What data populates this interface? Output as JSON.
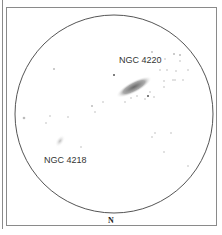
{
  "chart": {
    "labels": {
      "galaxy1": "NGC 4220",
      "galaxy2": "NGC 4218",
      "orientation": "N"
    }
  }
}
